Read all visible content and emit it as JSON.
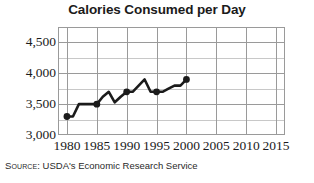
{
  "chart_data": {
    "type": "line",
    "title": "Calories Consumed per Day",
    "xlabel": "",
    "ylabel": "",
    "xlim": [
      1978.5,
      2016.5
    ],
    "ylim": [
      3000,
      4750
    ],
    "grid": true,
    "legend": "none",
    "y_major_ticks": [
      "3,000",
      "3,500",
      "4,000",
      "4,500"
    ],
    "y_major_values": [
      3000,
      3500,
      4000,
      4500
    ],
    "y_minor_values": [
      3250,
      3750,
      4250,
      4750
    ],
    "x_ticks": [
      "1980",
      "1985",
      "1990",
      "1995",
      "2000",
      "2005",
      "2010",
      "2015"
    ],
    "x_values": [
      1980,
      1985,
      1990,
      1995,
      2000,
      2005,
      2010,
      2015
    ],
    "series": [
      {
        "name": "Calories Consumed per Day",
        "color": "#1b1b1b",
        "x": [
          1980,
          1981,
          1982,
          1983,
          1984,
          1985,
          1986,
          1987,
          1988,
          1989,
          1990,
          1991,
          1992,
          1993,
          1994,
          1995,
          1996,
          1997,
          1998,
          1999,
          2000
        ],
        "values": [
          3300,
          3300,
          3500,
          3500,
          3500,
          3500,
          3620,
          3700,
          3530,
          3620,
          3700,
          3700,
          3800,
          3900,
          3700,
          3700,
          3700,
          3750,
          3800,
          3800,
          3900
        ],
        "marker_x": [
          1980,
          1985,
          1990,
          1995,
          2000
        ],
        "marker_values": [
          3300,
          3500,
          3700,
          3700,
          3900
        ]
      }
    ],
    "annotations": {
      "source_label": "Source:",
      "source_text": "USDA's Economic Research Service"
    }
  }
}
